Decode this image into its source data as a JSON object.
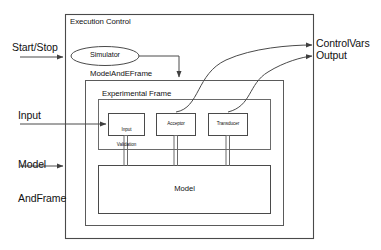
{
  "diagram": {
    "title": "Execution Control",
    "containers": {
      "execution_control": "Execution Control",
      "model_and_eframe": "ModelAndEFrame",
      "experimental_frame": "Experimental Frame"
    },
    "nodes": {
      "simulator": "Simulator",
      "input_validation_line1": "Input",
      "input_validation_line2": "Validation",
      "acceptor": "Acceptor",
      "transducer": "Transducer",
      "model": "Model"
    },
    "inputs": {
      "start_stop": "Start/Stop",
      "input": "Input",
      "model_and_frame_line1": "Model",
      "model_and_frame_line2": "AndFrame"
    },
    "outputs": {
      "control_vars": "ControlVars",
      "output": "Output"
    },
    "colors": {
      "stroke": "#3f3f3f",
      "stroke_light": "#6e6e6e",
      "text": "#111111",
      "background": "#ffffff"
    }
  }
}
